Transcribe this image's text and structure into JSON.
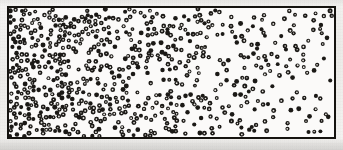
{
  "figure": {
    "kind": "scanned-scientific-diagram",
    "canvas": {
      "width": 343,
      "height": 150
    },
    "background_color": "#f4f3f1",
    "paper_tone": "#efeeeb"
  },
  "container": {
    "label": "particle-container",
    "x": 7,
    "y": 6,
    "width": 329,
    "height": 133,
    "border_color": "#15130f",
    "border_width": 2,
    "fill_color": "#fbfaf9"
  },
  "particles": {
    "label": "particle-field",
    "marker_shape": "filled-circle",
    "marker_color": "#1b1916",
    "marker_core_color": "#e8e6e2",
    "marker_diameter_px": 4.4,
    "marker_core_diameter_px": 1.5,
    "total_count": 690,
    "seed": 20240518,
    "distribution": "horizontal-exponential-decay",
    "min_separation_px": 3.4,
    "density_profile": {
      "axis": "x",
      "left_relative_density": 1.0,
      "right_relative_density": 0.085,
      "decay_constant": 0.3,
      "vertical_distribution": "uniform"
    }
  },
  "chart_data": {
    "type": "scatter",
    "title": "",
    "xlabel": "",
    "ylabel": "",
    "xlim": [
      0,
      1
    ],
    "ylim": [
      0,
      1
    ],
    "grid": false,
    "legend": null,
    "series": [
      {
        "name": "particles",
        "marker": "o",
        "color": "#1b1916",
        "count": 690
      }
    ],
    "density_bins": {
      "bin_edges_x": [
        0.0,
        0.1,
        0.2,
        0.3,
        0.4,
        0.5,
        0.6,
        0.7,
        0.8,
        0.9,
        1.0
      ],
      "relative_density": [
        1.0,
        0.8,
        0.62,
        0.48,
        0.37,
        0.29,
        0.22,
        0.17,
        0.13,
        0.09
      ],
      "counts": [
        138,
        110,
        86,
        66,
        51,
        40,
        30,
        24,
        18,
        13
      ]
    }
  }
}
